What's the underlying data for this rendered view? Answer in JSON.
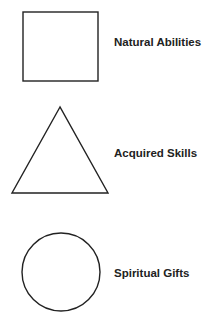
{
  "diagram": {
    "items": [
      {
        "shape": "square",
        "label": "Natural Abilities"
      },
      {
        "shape": "triangle",
        "label": "Acquired Skills"
      },
      {
        "shape": "circle",
        "label": "Spiritual Gifts"
      }
    ],
    "colors": {
      "stroke": "#222222",
      "text": "#222222",
      "background": "#ffffff"
    }
  }
}
